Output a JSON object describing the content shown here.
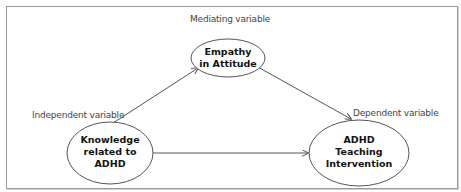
{
  "diagram": {
    "type": "mediation-model",
    "nodes": {
      "mediator": {
        "line1": "Empathy",
        "line2": "in Attitude",
        "role_label": "Mediating variable"
      },
      "independent": {
        "line1": "Knowledge",
        "line2": "related to",
        "line3": "ADHD",
        "role_label": "Independent variable"
      },
      "dependent": {
        "line1": "ADHD",
        "line2": "Teaching",
        "line3": "Intervention",
        "role_label": "Dependent variable"
      }
    },
    "edges": [
      {
        "from": "independent",
        "to": "mediator"
      },
      {
        "from": "mediator",
        "to": "dependent"
      },
      {
        "from": "independent",
        "to": "dependent"
      }
    ],
    "colors": {
      "stroke": "#555555",
      "frame": "#9a9a9a",
      "text": "#111111",
      "label": "#444444"
    }
  }
}
